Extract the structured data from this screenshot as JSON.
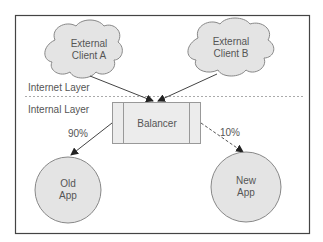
{
  "diagram": {
    "layers": {
      "internet": "Internet Layer",
      "internal": "Internal Layer"
    },
    "nodes": {
      "client_a": {
        "line1": "External",
        "line2": "Client A",
        "shape": "cloud"
      },
      "client_b": {
        "line1": "External",
        "line2": "Client B",
        "shape": "cloud"
      },
      "balancer": {
        "label": "Balancer",
        "shape": "process-box"
      },
      "old_app": {
        "line1": "Old",
        "line2": "App",
        "shape": "circle"
      },
      "new_app": {
        "line1": "New",
        "line2": "App",
        "shape": "circle"
      }
    },
    "edges": [
      {
        "from": "client_a",
        "to": "balancer",
        "style": "solid",
        "label": ""
      },
      {
        "from": "client_b",
        "to": "balancer",
        "style": "solid",
        "label": ""
      },
      {
        "from": "balancer",
        "to": "old_app",
        "style": "solid",
        "label": "90%"
      },
      {
        "from": "balancer",
        "to": "new_app",
        "style": "dashed",
        "label": "10%"
      }
    ],
    "colors": {
      "fill": "#e4e4e4",
      "stroke": "#777777",
      "border": "#444444",
      "text": "#555555"
    }
  }
}
